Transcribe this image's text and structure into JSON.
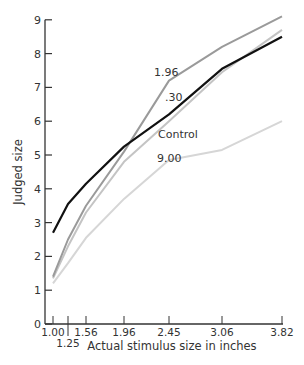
{
  "chart_data": {
    "type": "line",
    "title": "",
    "xlabel": "Actual stimulus size in inches",
    "ylabel": "Judged size",
    "x": [
      1.0,
      1.25,
      1.56,
      1.96,
      2.45,
      3.06,
      3.82
    ],
    "x_tick_labels": [
      "1.00",
      "1.25",
      "1.56",
      "1.96",
      "2.45",
      "3.06",
      "3.82"
    ],
    "y_ticks": [
      0,
      1,
      2,
      3,
      4,
      5,
      6,
      7,
      8,
      9
    ],
    "ylim": [
      0,
      9
    ],
    "grid": false,
    "series": [
      {
        "name": "1.96",
        "color": "#9a9a9a",
        "values": [
          1.4,
          2.5,
          3.5,
          5.1,
          7.2,
          8.2,
          9.1
        ]
      },
      {
        "name": ".30",
        "color": "#c4c4c4",
        "values": [
          1.35,
          2.3,
          3.3,
          4.8,
          6.0,
          7.45,
          8.7
        ]
      },
      {
        "name": "Control",
        "color": "#111111",
        "values": [
          2.7,
          3.55,
          4.15,
          5.25,
          6.2,
          7.55,
          8.5
        ]
      },
      {
        "name": "9.00",
        "color": "#d6d6d6",
        "values": [
          1.2,
          1.8,
          2.55,
          3.7,
          4.85,
          5.15,
          6.0
        ]
      }
    ],
    "annotations": [
      {
        "text": "1.96",
        "series": "1.96"
      },
      {
        "text": ".30",
        "series": ".30"
      },
      {
        "text": "Control",
        "series": "Control"
      },
      {
        "text": "9.00",
        "series": "9.00"
      }
    ]
  }
}
